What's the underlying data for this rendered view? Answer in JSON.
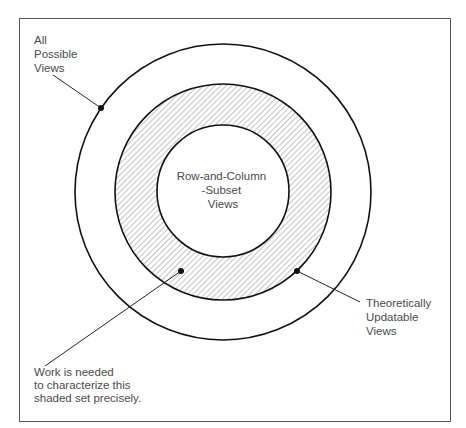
{
  "diagram": {
    "type": "nested-set-diagram",
    "sets": [
      {
        "id": "all",
        "label_lines": [
          "All",
          "Possible",
          "Views"
        ],
        "cx": 223,
        "cy": 192,
        "r": 148,
        "shaded": false
      },
      {
        "id": "updatable",
        "label_lines": [
          "Theoretically",
          "Updatable",
          "Views"
        ],
        "cx": 223,
        "cy": 192,
        "r": 108,
        "shaded": true
      },
      {
        "id": "row-column",
        "label_lines": [
          "Row-and-Column",
          "-Subset",
          "Views"
        ],
        "cx": 223,
        "cy": 191,
        "r": 66,
        "shaded": false
      }
    ],
    "callouts": {
      "all_possible": {
        "lines": [
          "All",
          "Possible",
          "Views"
        ]
      },
      "theoretically_updatable": {
        "lines": [
          "Theoretically",
          "Updatable",
          "Views"
        ]
      },
      "row_column": {
        "lines": [
          "Row-and-Column",
          "-Subset",
          "Views"
        ]
      },
      "work_needed": {
        "lines": [
          "Work is needed",
          "to characterize this",
          "shaded set precisely."
        ]
      }
    },
    "colors": {
      "stroke": "#111111",
      "hatch": "#8a8a8a",
      "text": "#4a4a4a",
      "frame": "#555555"
    }
  }
}
